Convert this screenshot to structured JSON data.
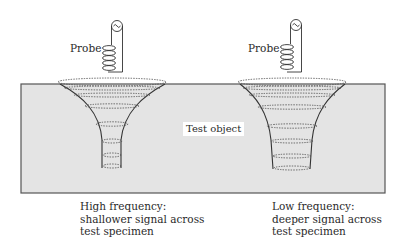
{
  "diagram": {
    "type": "eddy-current-penetration-comparison",
    "test_object": {
      "label": "Test object",
      "fill_color": "#e4e4e4",
      "border_color": "#555555"
    },
    "probes": [
      {
        "label": "Probe",
        "frequency": "High",
        "caption_lines": [
          "High frequency:",
          "shallower signal across",
          "test specimen"
        ]
      },
      {
        "label": "Probe",
        "frequency": "Low",
        "caption_lines": [
          "Low frequency:",
          "deeper signal across",
          "test specimen"
        ]
      }
    ],
    "icons": {
      "ac_source": "ac-source-icon",
      "coil": "coil-icon",
      "field_funnel": "eddy-current-funnel"
    }
  }
}
